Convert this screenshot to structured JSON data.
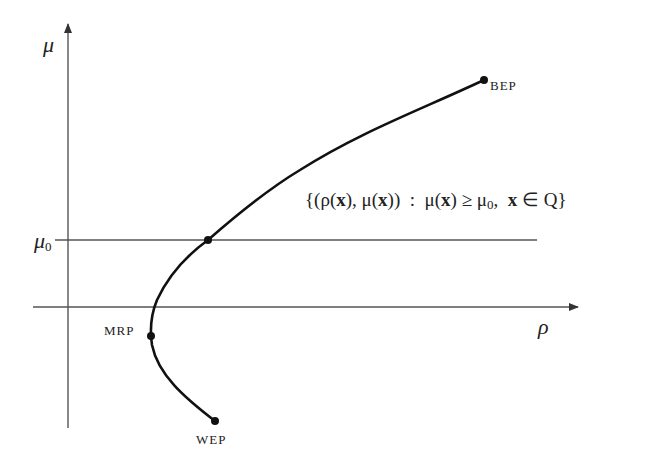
{
  "diagram": {
    "axes": {
      "y_label": "μ",
      "x_label": "ρ"
    },
    "threshold": {
      "symbol": "μ",
      "subscript": "0"
    },
    "points": {
      "best": "BEP",
      "min_risk": "MRP",
      "worst": "WEP"
    },
    "set_notation": {
      "open": "{(ρ(",
      "x1": "x",
      "mid1": "), μ(",
      "x2": "x",
      "mid2": "))  :  μ(",
      "x3": "x",
      "mid3": ") ≥ μ",
      "sub": "0",
      "mid4": ",  ",
      "x4": "x",
      "close": " ∈ Q}"
    },
    "colors": {
      "axis": "#555555",
      "curve": "#111111",
      "text": "#222222"
    }
  }
}
